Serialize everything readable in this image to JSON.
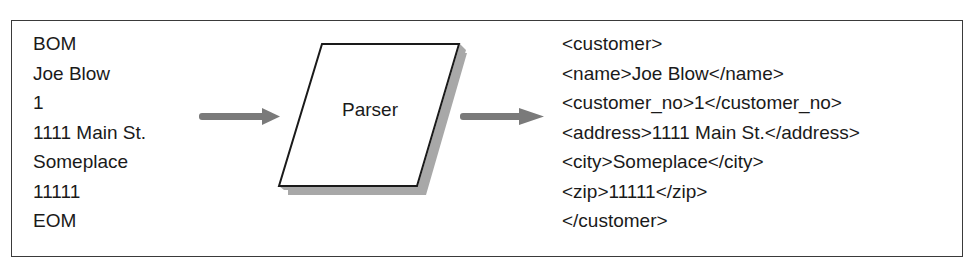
{
  "input": {
    "lines": [
      "BOM",
      "Joe Blow",
      "1",
      "1111 Main St.",
      "Someplace",
      "11111",
      "EOM"
    ]
  },
  "parser": {
    "label": "Parser"
  },
  "output": {
    "lines": [
      "<customer>",
      "<name>Joe Blow</name>",
      "<customer_no>1</customer_no>",
      "<address>1111 Main St.</address>",
      "<city>Someplace</city>",
      "<zip>11111</zip>",
      "</customer>"
    ]
  },
  "colors": {
    "arrow": "#7a7a7a",
    "shadow": "#a8a8a8",
    "border": "#1a1a1a"
  }
}
